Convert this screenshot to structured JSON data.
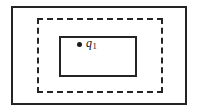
{
  "diagram": {
    "background_color": "#ffffff",
    "stroke_color": "#242424",
    "regions": [
      {
        "id": "outer-region",
        "name": "outer-boundary",
        "style": "solid",
        "label": ""
      },
      {
        "id": "middle-region",
        "name": "dashed-boundary",
        "style": "dashed",
        "label": ""
      },
      {
        "id": "inner-region",
        "name": "inner-boundary",
        "style": "solid",
        "label": ""
      }
    ],
    "points": [
      {
        "id": "q1",
        "marker": "filled-dot",
        "marker_color": "#1a1a1a",
        "label_base": "q",
        "label_subscript": "1"
      }
    ]
  }
}
